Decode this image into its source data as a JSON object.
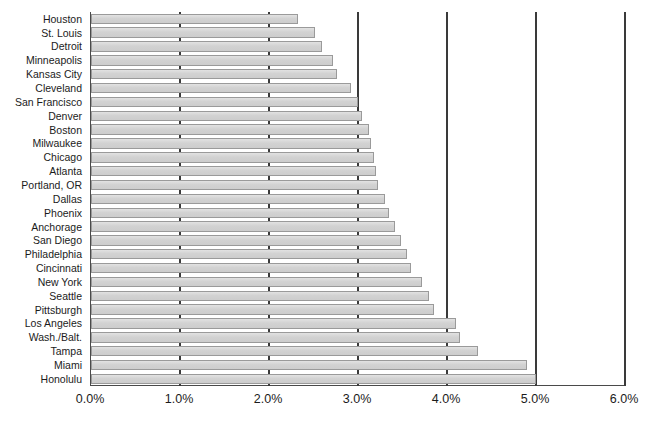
{
  "chart_data": {
    "type": "bar",
    "orientation": "horizontal",
    "title": "",
    "xlabel": "",
    "ylabel": "",
    "xlim": [
      0,
      6
    ],
    "xtick_labels": [
      "0.0%",
      "1.0%",
      "2.0%",
      "3.0%",
      "4.0%",
      "5.0%",
      "6.0%"
    ],
    "xtick_values": [
      0,
      1,
      2,
      3,
      4,
      5,
      6
    ],
    "grid": true,
    "grid_axis": "x",
    "legend": false,
    "bar_color": "#d2d2d2",
    "bar_border_color": "#9a9a9a",
    "axis_color": "#3a3a3a",
    "sort_order": "ascending-top-to-bottom",
    "categories": [
      "Houston",
      "St. Louis",
      "Detroit",
      "Minneapolis",
      "Kansas City",
      "Cleveland",
      "San Francisco",
      "Denver",
      "Boston",
      "Milwaukee",
      "Chicago",
      "Atlanta",
      "Portland, OR",
      "Dallas",
      "Phoenix",
      "Anchorage",
      "San Diego",
      "Philadelphia",
      "Cincinnati",
      "New York",
      "Seattle",
      "Pittsburgh",
      "Los Angeles",
      "Wash./Balt.",
      "Tampa",
      "Miami",
      "Honolulu"
    ],
    "values": [
      2.33,
      2.52,
      2.6,
      2.72,
      2.76,
      2.92,
      3.0,
      3.05,
      3.12,
      3.15,
      3.18,
      3.2,
      3.22,
      3.3,
      3.35,
      3.42,
      3.48,
      3.55,
      3.6,
      3.72,
      3.8,
      3.85,
      4.1,
      4.15,
      4.35,
      4.9,
      5.0
    ]
  },
  "fragments": {
    "title_cut": "",
    "caption_cut": ""
  }
}
